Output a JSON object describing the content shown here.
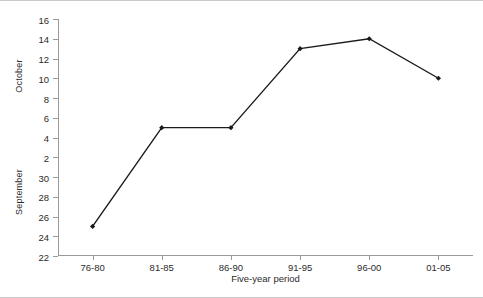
{
  "chart_data": {
    "type": "line",
    "title": "",
    "xlabel": "Five-year period",
    "ylabel": "",
    "categories": [
      "76-80",
      "81-85",
      "86-90",
      "91-95",
      "96-00",
      "01-05"
    ],
    "values": [
      25,
      5,
      5,
      13,
      14,
      10
    ],
    "series": [
      {
        "name": "",
        "values": [
          25,
          5,
          5,
          13,
          14,
          10
        ]
      }
    ],
    "y_axis": {
      "split": true,
      "tick_labels": [
        "16",
        "14",
        "12",
        "10",
        "8",
        "6",
        "4",
        "2",
        "30",
        "28",
        "26",
        "24",
        "22"
      ],
      "upper_band_label": "October",
      "upper_band_range": [
        2,
        16
      ],
      "lower_band_label": "September",
      "lower_band_range": [
        22,
        32
      ],
      "description": "Continuous descending axis: October 16 down to 2, then September 30 down to 22"
    },
    "grid": false,
    "legend": false,
    "marker": "filled-diamond",
    "line_color": "#1a1a1a",
    "axis_color": "#9a9a9a",
    "text_color": "#2b2b2b"
  },
  "axis_titles": {
    "october": "October",
    "september": "September",
    "x": "Five-year period"
  }
}
